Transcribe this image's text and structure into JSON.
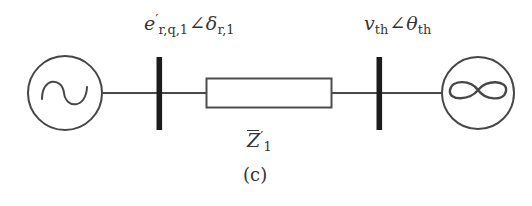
{
  "figure": {
    "caption": "(c)",
    "type": "single-line-diagram"
  },
  "labels": {
    "source_voltage": {
      "symbol": "e",
      "prime": "′",
      "symbol_sub": "r,q,1",
      "angle_glyph": "∠",
      "angle_symbol": "δ",
      "angle_sub": "r,1",
      "plain": "e'_{r,q,1} ∠ δ_{r,1}"
    },
    "thevenin_voltage": {
      "symbol": "v",
      "symbol_sub": "th",
      "angle_glyph": "∠",
      "angle_symbol": "θ",
      "angle_sub": "th",
      "plain": "v_{th} ∠ θ_{th}"
    },
    "impedance": {
      "symbol": "Z",
      "overbar": true,
      "prime": "′",
      "symbol_sub": "1",
      "plain": "Z̄'_1"
    }
  },
  "components": {
    "ac_source": {
      "name": "ac-voltage-source",
      "glyph": "∿",
      "shape": "circle-with-sine"
    },
    "infinite_bus": {
      "name": "infinite-bus",
      "glyph": "∞",
      "shape": "circle-with-infinity"
    },
    "bus_left": {
      "name": "bus-bar-left",
      "shape": "thick-vertical-bar"
    },
    "bus_right": {
      "name": "bus-bar-right",
      "shape": "thick-vertical-bar"
    },
    "impedance_block": {
      "name": "series-impedance",
      "shape": "rectangle"
    }
  },
  "colors": {
    "ink": "#353535",
    "bus_bar": "#1c1c1c",
    "background": "#ffffff",
    "line": "#4a4a4a"
  },
  "geometry": {
    "width": 532,
    "height": 206,
    "baseline_y": 93,
    "source_circle": {
      "cx": 65,
      "cy": 93,
      "r": 37
    },
    "infinite_circle": {
      "cx": 478,
      "cy": 93,
      "r": 36
    },
    "bus_left_x": 159,
    "bus_right_x": 379,
    "bus_top_y": 57,
    "bus_bottom_y": 130,
    "impedance_rect": {
      "x": 206,
      "y": 78,
      "w": 126,
      "h": 30
    }
  }
}
